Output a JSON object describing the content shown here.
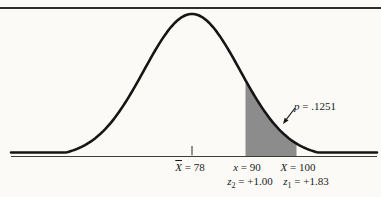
{
  "figure": {
    "background": "#fbfaf7",
    "top_rule_color": "#2e2e2e",
    "curve_color": "#151515",
    "axis_color": "#3c3c3c",
    "shade_color": "#8c8c8c",
    "text_color": "#1a1a1a"
  },
  "chart_data": {
    "type": "area",
    "distribution": "normal",
    "mean": 78,
    "std_dev": 12,
    "x_axis": "score scale (unlabeled line)",
    "points": [
      {
        "label": "X̄ = 78",
        "score": 78,
        "role": "mean"
      },
      {
        "label": "x = 90",
        "score": 90,
        "z": 1.0,
        "z_label": "z2 = +1.00"
      },
      {
        "label": "X = 100",
        "score": 100,
        "z": 1.83,
        "z_label": "z1 = +1.83"
      }
    ],
    "shaded_region": {
      "from": 90,
      "to": 100,
      "probability": 0.1251,
      "annotation": "p = .1251"
    },
    "legend": "none",
    "grid": false
  },
  "labels": {
    "mean": {
      "var": "X",
      "rest": " = 78"
    },
    "x_lower": {
      "var": "x",
      "rest": " = 90"
    },
    "x_upper": {
      "var": "X",
      "rest": " = 100"
    },
    "z_lower": {
      "base": "z",
      "sub": "2",
      "rest": " = +1.00"
    },
    "z_upper": {
      "base": "z",
      "sub": "1",
      "rest": " = +1.83"
    },
    "p": {
      "var": "p",
      "rest": " = .1251"
    }
  }
}
